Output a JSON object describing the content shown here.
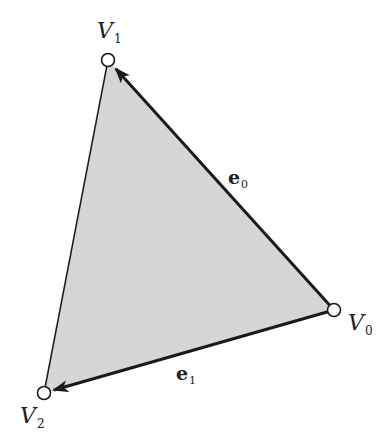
{
  "diagram": {
    "type": "triangle-edge-vectors",
    "fill_color": "#d8d8d8",
    "stroke_color": "#1a1a1a",
    "vertices": [
      {
        "id": "V0",
        "base": "V",
        "sub": "0",
        "x": 334,
        "y": 310
      },
      {
        "id": "V1",
        "base": "V",
        "sub": "1",
        "x": 108,
        "y": 60
      },
      {
        "id": "V2",
        "base": "V",
        "sub": "2",
        "x": 44,
        "y": 393
      }
    ],
    "edges": [
      {
        "id": "e0",
        "base": "e",
        "sub": "0",
        "from": "V0",
        "to": "V1",
        "arrow": true
      },
      {
        "id": "e1",
        "base": "e",
        "sub": "1",
        "from": "V0",
        "to": "V2",
        "arrow": true
      },
      {
        "id": "side",
        "from": "V1",
        "to": "V2",
        "arrow": false
      }
    ]
  }
}
